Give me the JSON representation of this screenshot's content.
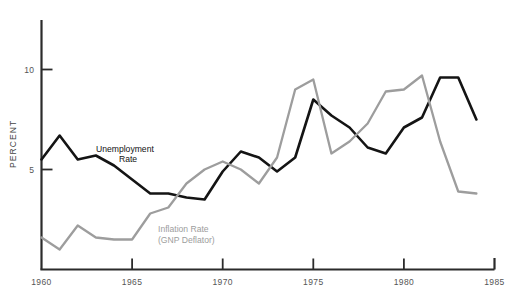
{
  "chart_data": {
    "type": "line",
    "title": "",
    "xlabel": "",
    "ylabel": "PERCENT",
    "xlim": [
      1960,
      1985
    ],
    "ylim": [
      0,
      12.45
    ],
    "grid": false,
    "legend_position": "inline-annotation",
    "xticks": [
      "1960",
      "1965",
      "1970",
      "1975",
      "1980",
      "1985"
    ],
    "xtick_values": [
      1960,
      1965,
      1970,
      1975,
      1980,
      1985
    ],
    "yticks": [
      "5",
      "10"
    ],
    "ytick_values": [
      5,
      10
    ],
    "x": [
      1960,
      1961,
      1962,
      1963,
      1964,
      1965,
      1966,
      1967,
      1968,
      1969,
      1970,
      1971,
      1972,
      1973,
      1974,
      1975,
      1976,
      1977,
      1978,
      1979,
      1980,
      1981,
      1982,
      1983,
      1984
    ],
    "series": [
      {
        "name": "Unemployment Rate",
        "color": "#141414",
        "values": [
          5.5,
          6.7,
          5.5,
          5.7,
          5.2,
          4.5,
          3.8,
          3.8,
          3.6,
          3.5,
          4.9,
          5.9,
          5.6,
          4.9,
          5.6,
          8.5,
          7.7,
          7.1,
          6.1,
          5.8,
          7.1,
          7.6,
          9.6,
          9.6,
          7.5
        ]
      },
      {
        "name": "Inflation Rate (GNP Deflator)",
        "color": "#9d9d9d",
        "values": [
          1.6,
          1.0,
          2.2,
          1.6,
          1.5,
          1.5,
          2.8,
          3.1,
          4.3,
          5.0,
          5.4,
          5.0,
          4.3,
          5.6,
          9.0,
          9.5,
          5.8,
          6.4,
          7.3,
          8.9,
          9.0,
          9.7,
          6.4,
          3.9,
          3.8
        ]
      }
    ],
    "annotations": [
      {
        "name": "unemployment-annotation",
        "text_line1": "Unemployment",
        "text_line2": "Rate",
        "color": "#141414"
      },
      {
        "name": "inflation-annotation",
        "text_line1": "Inflation Rate",
        "text_line2": "(GNP Deflator)",
        "color": "#9d9d9d"
      }
    ]
  },
  "axis": {
    "y_title": "PERCENT",
    "x_ticks": [
      "1960",
      "1965",
      "1970",
      "1975",
      "1980",
      "1985"
    ],
    "y_ticks": [
      "5",
      "10"
    ]
  },
  "labels": {
    "unemployment_line1": "Unemployment",
    "unemployment_line2": "Rate",
    "inflation_line1": "Inflation Rate",
    "inflation_line2": "(GNP Deflator)"
  }
}
